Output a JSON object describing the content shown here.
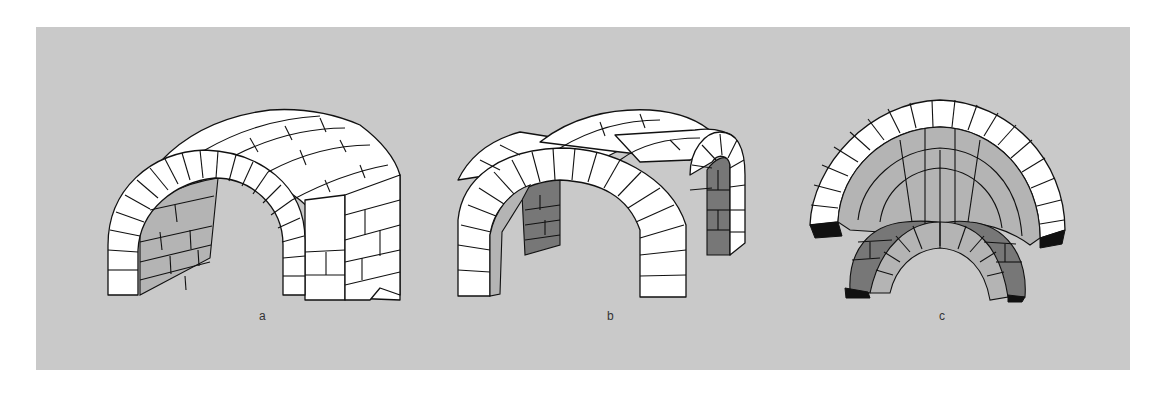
{
  "figure": {
    "background_color": "#c9c9c9",
    "stone_color": "#ffffff",
    "shade_light": "#b4b4b4",
    "shade_mid": "#9a9a9a",
    "shade_dark": "#7a7a7a",
    "line_color": "#111111",
    "panels": [
      {
        "id": "a",
        "label": "a",
        "depiction": "barrel vault with stepped masonry"
      },
      {
        "id": "b",
        "label": "b",
        "depiction": "groin vault formed by intersecting barrel vaults"
      },
      {
        "id": "c",
        "label": "c",
        "depiction": "groin vault viewed from below"
      }
    ]
  }
}
